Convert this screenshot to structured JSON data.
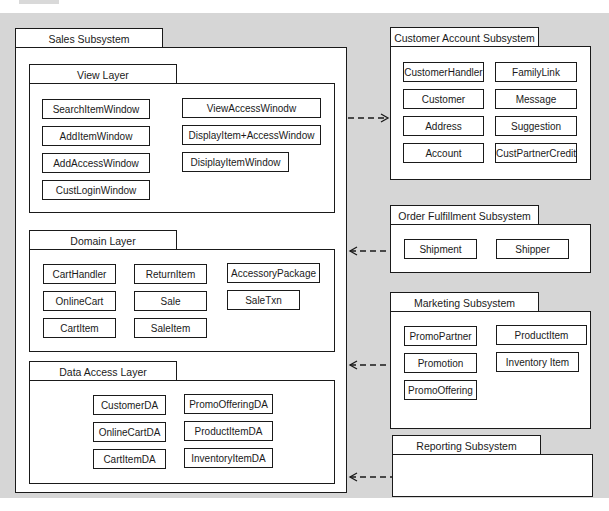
{
  "diagram": {
    "type": "UML package diagram",
    "background_color": "#d6d6d6",
    "line_color": "#1a1a1a"
  },
  "sales_subsystem": {
    "title": "Sales Subsystem",
    "view_layer": {
      "title": "View Layer",
      "classes": [
        "SearchItemWindow",
        "AddItemWindow",
        "AddAccessWindow",
        "CustLoginWindow",
        "ViewAccessWinodw",
        "DisplayItem+AccessWindow",
        "DisiplayItemWindow"
      ]
    },
    "domain_layer": {
      "title": "Domain Layer",
      "classes": [
        "CartHandler",
        "OnlineCart",
        "CartItem",
        "ReturnItem",
        "Sale",
        "SaleItem",
        "AccessoryPackage",
        "SaleTxn"
      ]
    },
    "data_access_layer": {
      "title": "Data Access Layer",
      "classes": [
        "CustomerDA",
        "OnlineCartDA",
        "CartItemDA",
        "PromoOfferingDA",
        "ProductItemDA",
        "InventoryItemDA"
      ]
    }
  },
  "customer_account_subsystem": {
    "title": "Customer Account Subsystem",
    "classes": [
      "CustomerHandler",
      "Customer",
      "Address",
      "Account",
      "FamilyLink",
      "Message",
      "Suggestion",
      "CustPartnerCredit"
    ]
  },
  "order_fulfillment_subsystem": {
    "title": "Order Fulfillment Subsystem",
    "classes": [
      "Shipment",
      "Shipper"
    ]
  },
  "marketing_subsystem": {
    "title": "Marketing Subsystem",
    "classes": [
      "PromoPartner",
      "Promotion",
      "PromoOffering",
      "ProductItem",
      "Inventory Item"
    ]
  },
  "reporting_subsystem": {
    "title": "Reporting Subsystem",
    "classes": []
  },
  "dependencies": [
    {
      "from": "Sales Subsystem",
      "to": "Customer Account Subsystem",
      "style": "dashed"
    },
    {
      "from": "Order Fulfillment Subsystem",
      "to": "Sales Subsystem",
      "style": "dashed"
    },
    {
      "from": "Marketing Subsystem",
      "to": "Sales Subsystem",
      "style": "dashed"
    },
    {
      "from": "Reporting Subsystem",
      "to": "Sales Subsystem",
      "style": "dashed"
    }
  ]
}
